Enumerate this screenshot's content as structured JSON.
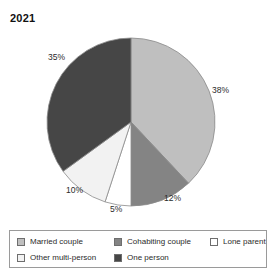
{
  "chart_data": {
    "type": "pie",
    "title": "2021",
    "xlabel": "",
    "ylabel": "",
    "legend_position": "bottom",
    "grid": false,
    "categories": [
      "Married couple",
      "Cohabiting couple",
      "Lone parent",
      "Other multi-person",
      "One person"
    ],
    "values": [
      38,
      12,
      5,
      10,
      35
    ],
    "value_labels": [
      "38%",
      "12%",
      "5%",
      "10%",
      "35%"
    ],
    "colors": [
      "#bfbfbf",
      "#848484",
      "#ffffff",
      "#f2f2f2",
      "#464646"
    ],
    "slice_order_clockwise_from_top": [
      "Married couple",
      "Cohabiting couple",
      "Lone parent",
      "Other multi-person",
      "One person"
    ]
  },
  "title": {
    "text": "2021"
  },
  "pie": {
    "slices": [
      {
        "name": "Married couple",
        "value": 38,
        "label": "38%",
        "color": "#bfbfbf"
      },
      {
        "name": "Cohabiting couple",
        "value": 12,
        "label": "12%",
        "color": "#848484"
      },
      {
        "name": "Lone parent",
        "value": 5,
        "label": "5%",
        "color": "#ffffff"
      },
      {
        "name": "Other multi-person",
        "value": 10,
        "label": "10%",
        "color": "#f2f2f2"
      },
      {
        "name": "One person",
        "value": 35,
        "label": "35%",
        "color": "#464646"
      }
    ]
  },
  "legend": {
    "rows": [
      [
        {
          "label": "Married couple",
          "color": "#bfbfbf"
        },
        {
          "label": "Cohabiting couple",
          "color": "#848484"
        },
        {
          "label": "Lone parent",
          "color": "#ffffff"
        }
      ],
      [
        {
          "label": "Other multi-person",
          "color": "#f2f2f2"
        },
        {
          "label": "One person",
          "color": "#464646"
        }
      ]
    ]
  }
}
